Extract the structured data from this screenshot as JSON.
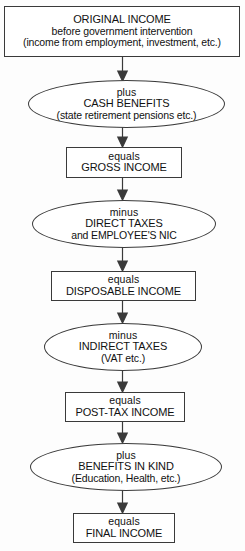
{
  "diagram": {
    "stroke_color": "#3a3a3a",
    "background_color": "#fdfdfd",
    "text_color": "#111111",
    "nodes": [
      {
        "id": "original-income",
        "shape": "box",
        "operator": "",
        "heading": "ORIGINAL INCOME",
        "line2": "before government intervention",
        "line3": "(income from employment, investment, etc.)"
      },
      {
        "id": "cash-benefits",
        "shape": "ellipse",
        "operator": "plus",
        "heading": "CASH BENEFITS",
        "line2": "(state retirement pensions etc.)",
        "line3": ""
      },
      {
        "id": "gross-income",
        "shape": "box",
        "operator": "equals",
        "heading": "GROSS INCOME",
        "line2": "",
        "line3": ""
      },
      {
        "id": "direct-taxes",
        "shape": "ellipse",
        "operator": "minus",
        "heading": "DIRECT TAXES",
        "line2": "and EMPLOYEE'S NIC",
        "line3": ""
      },
      {
        "id": "disposable-income",
        "shape": "box",
        "operator": "equals",
        "heading": "DISPOSABLE INCOME",
        "line2": "",
        "line3": ""
      },
      {
        "id": "indirect-taxes",
        "shape": "ellipse",
        "operator": "minus",
        "heading": "INDIRECT TAXES",
        "line2": "(VAT  etc.)",
        "line3": ""
      },
      {
        "id": "post-tax-income",
        "shape": "box",
        "operator": "equals",
        "heading": "POST-TAX INCOME",
        "line2": "",
        "line3": ""
      },
      {
        "id": "benefits-in-kind",
        "shape": "ellipse",
        "operator": "plus",
        "heading": "BENEFITS IN KIND",
        "line2": "(Education, Health, etc.)",
        "line3": ""
      },
      {
        "id": "final-income",
        "shape": "box",
        "operator": "equals",
        "heading": "FINAL INCOME",
        "line2": "",
        "line3": ""
      }
    ]
  }
}
